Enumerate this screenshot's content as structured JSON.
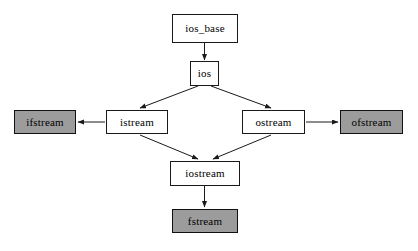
{
  "diagram": {
    "background_color": "#ffffff",
    "stroke_color": "#1a1a1a",
    "plain_fill": "#ffffff",
    "filled_fill": "#9c9c9c",
    "nodes": [
      {
        "id": "ios_base",
        "label": "ios_base",
        "style": "plain",
        "x": 172,
        "y": 14,
        "w": 66,
        "h": 29
      },
      {
        "id": "ios",
        "label": "ios",
        "style": "plain",
        "x": 190,
        "y": 61,
        "w": 29,
        "h": 25
      },
      {
        "id": "ifstream",
        "label": "ifstream",
        "style": "filled",
        "x": 14,
        "y": 110,
        "w": 62,
        "h": 24
      },
      {
        "id": "istream",
        "label": "istream",
        "style": "plain",
        "x": 106,
        "y": 110,
        "w": 62,
        "h": 24
      },
      {
        "id": "ostream",
        "label": "ostream",
        "style": "plain",
        "x": 242,
        "y": 110,
        "w": 63,
        "h": 24
      },
      {
        "id": "ofstream",
        "label": "ofstream",
        "style": "filled",
        "x": 340,
        "y": 110,
        "w": 63,
        "h": 24
      },
      {
        "id": "iostream",
        "label": "iostream",
        "style": "plain",
        "x": 170,
        "y": 161,
        "w": 70,
        "h": 25
      },
      {
        "id": "fstream",
        "label": "fstream",
        "style": "filled",
        "x": 172,
        "y": 209,
        "w": 66,
        "h": 24
      }
    ],
    "edges": [
      {
        "id": "ios_base-to-ios",
        "from": "ios_base",
        "to": "ios",
        "kind": "arrow",
        "direction": "down",
        "x1": 204.5,
        "y1": 43,
        "x2": 204.5,
        "y2": 60
      },
      {
        "id": "ios-to-istream",
        "from": "ios",
        "to": "istream",
        "kind": "arrow",
        "direction": "down-left",
        "x1": 198,
        "y1": 86,
        "x2": 140,
        "y2": 108
      },
      {
        "id": "ios-to-ostream",
        "from": "ios",
        "to": "ostream",
        "kind": "arrow",
        "direction": "down-right",
        "x1": 211,
        "y1": 86,
        "x2": 271,
        "y2": 108
      },
      {
        "id": "istream-to-ifstream",
        "from": "istream",
        "to": "ifstream",
        "kind": "arrow",
        "direction": "left",
        "x1": 105,
        "y1": 122,
        "x2": 78,
        "y2": 122
      },
      {
        "id": "ostream-to-ofstream",
        "from": "ostream",
        "to": "ofstream",
        "kind": "arrow",
        "direction": "right",
        "x1": 306,
        "y1": 122,
        "x2": 338,
        "y2": 122
      },
      {
        "id": "istream-to-iostream",
        "from": "istream",
        "to": "iostream",
        "kind": "arrow",
        "direction": "down-right",
        "x1": 140,
        "y1": 135,
        "x2": 198,
        "y2": 159
      },
      {
        "id": "ostream-to-iostream",
        "from": "ostream",
        "to": "iostream",
        "kind": "arrow",
        "direction": "down-left",
        "x1": 271,
        "y1": 135,
        "x2": 213,
        "y2": 159
      },
      {
        "id": "iostream-to-fstream",
        "from": "iostream",
        "to": "fstream",
        "kind": "arrow",
        "direction": "down",
        "x1": 204.5,
        "y1": 186,
        "x2": 204.5,
        "y2": 207
      }
    ]
  }
}
